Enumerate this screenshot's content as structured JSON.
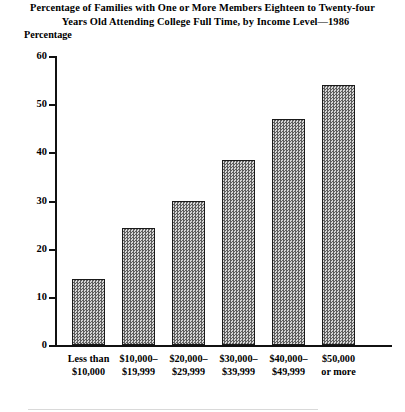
{
  "chart_data": {
    "type": "bar",
    "title": "Percentage of Families with One or More Members Eighteen to Twenty-four Years Old Attending College Full Time, by Income Level—1986",
    "title_lines": [
      "Percentage of Families with One or More Members Eighteen to Twenty-four",
      "Years Old Attending College Full Time, by Income Level—1986"
    ],
    "xlabel": "",
    "ylabel": "Percentage",
    "categories": [
      "Less than $10,000",
      "$10,000–$19,999",
      "$20,000–$29,999",
      "$30,000–$39,999",
      "$40,000–$49,999",
      "$50,000 or more"
    ],
    "category_lines": [
      [
        "Less than",
        "$10,000"
      ],
      [
        "$10,000–",
        "$19,999"
      ],
      [
        "$20,000–",
        "$29,999"
      ],
      [
        "$30,000–",
        "$39,999"
      ],
      [
        "$40,000–",
        "$49,999"
      ],
      [
        "$50,000",
        "or more"
      ]
    ],
    "values": [
      13.8,
      24.2,
      30.0,
      38.5,
      47.0,
      54.0
    ],
    "ylim": [
      0,
      60
    ],
    "yticks": [
      0,
      10,
      20,
      30,
      40,
      50,
      60
    ],
    "ytick_labels": [
      "0",
      "10",
      "20",
      "30",
      "40",
      "50",
      "60"
    ],
    "grid": false,
    "legend": false,
    "bar_fill": "#8a8a8a",
    "bar_edge": "#1a1a1a",
    "axis_color": "#111111"
  }
}
